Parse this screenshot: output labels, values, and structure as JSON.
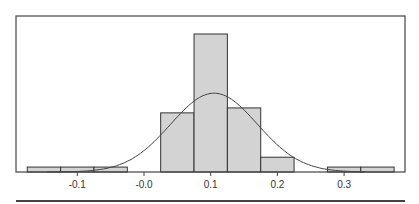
{
  "chart_data": {
    "type": "bar",
    "subtype": "histogram_with_normal_curve",
    "title": "",
    "xlabel": "",
    "ylabel": "",
    "bin_width": 0.05,
    "bins": [
      {
        "start": -0.175,
        "end": -0.125,
        "count": 1
      },
      {
        "start": -0.125,
        "end": -0.075,
        "count": 1
      },
      {
        "start": -0.075,
        "end": -0.025,
        "count": 1
      },
      {
        "start": 0.025,
        "end": 0.075,
        "count": 12
      },
      {
        "start": 0.075,
        "end": 0.125,
        "count": 28
      },
      {
        "start": 0.125,
        "end": 0.175,
        "count": 13
      },
      {
        "start": 0.175,
        "end": 0.225,
        "count": 3
      },
      {
        "start": 0.275,
        "end": 0.325,
        "count": 1
      },
      {
        "start": 0.325,
        "end": 0.375,
        "count": 1
      }
    ],
    "categories": [
      "-0.15",
      "-0.10",
      "-0.05",
      "0.05",
      "0.10",
      "0.15",
      "0.20",
      "0.30",
      "0.35"
    ],
    "values": [
      1,
      1,
      1,
      12,
      28,
      13,
      3,
      1,
      1
    ],
    "normal_curve": {
      "mean": 0.105,
      "sd": 0.065,
      "peak_count": 16
    },
    "x_ticks": [
      -0.1,
      0.0,
      0.1,
      0.2,
      0.3
    ],
    "x_tick_labels": [
      "-0.1",
      "-0.0",
      "0.1",
      "0.2",
      "0.3"
    ],
    "xlim": [
      -0.185,
      0.395
    ],
    "ylim": [
      0,
      28
    ],
    "grid": false,
    "legend": null,
    "colors": {
      "bar_fill": "#d3d3d3",
      "bar_edge": "#333333",
      "curve": "#444444",
      "frame": "#444444"
    }
  }
}
